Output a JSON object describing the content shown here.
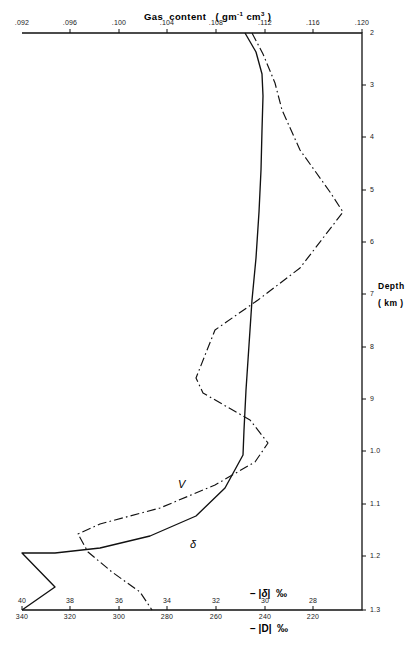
{
  "chart_data": {
    "type": "line",
    "orientation": "vertical-depth-profile",
    "grid": false,
    "legend": "inline-curve-labels",
    "axes": {
      "top": {
        "label": "Gas content  ( gm⁻¹ cm³ )",
        "ticks": [
          ".092",
          ".096",
          ".100",
          ".104",
          ".108",
          ".112",
          ".116",
          ".120"
        ],
        "range": [
          0.092,
          0.12
        ]
      },
      "right": {
        "label_line1": "Depth",
        "label_line2": "( km )",
        "ticks": [
          "2",
          "3",
          "4",
          "5",
          "6",
          "7",
          "8",
          "9",
          "1.0",
          "1.1",
          "1.2",
          "1.3"
        ],
        "range": [
          2,
          13
        ]
      },
      "bottom_primary": {
        "label": "- |δ|   ‰",
        "ticks": [
          "40",
          "38",
          "36",
          "34",
          "32",
          "30",
          "28"
        ],
        "range": [
          40,
          28
        ],
        "reversed": true
      },
      "bottom_secondary": {
        "label": "- |D|   ‰",
        "ticks": [
          "340",
          "320",
          "300",
          "280",
          "260",
          "240",
          "220"
        ],
        "range": [
          340,
          220
        ],
        "reversed": true
      }
    },
    "series": [
      {
        "name": "V",
        "style": "dash-dot",
        "label_text": "V",
        "points_px": [
          [
            252,
            33
          ],
          [
            263,
            54
          ],
          [
            275,
            83
          ],
          [
            282,
            110
          ],
          [
            300,
            150
          ],
          [
            330,
            192
          ],
          [
            343,
            212
          ],
          [
            300,
            268
          ],
          [
            258,
            300
          ],
          [
            215,
            330
          ],
          [
            196,
            378
          ],
          [
            203,
            393
          ],
          [
            250,
            420
          ],
          [
            268,
            443
          ],
          [
            255,
            462
          ],
          [
            215,
            485
          ],
          [
            160,
            508
          ],
          [
            100,
            524
          ],
          [
            78,
            534
          ],
          [
            88,
            552
          ],
          [
            112,
            572
          ],
          [
            140,
            592
          ],
          [
            152,
            610
          ]
        ]
      },
      {
        "name": "delta",
        "style": "solid",
        "label_text": "δ",
        "points_px": [
          [
            245,
            33
          ],
          [
            256,
            52
          ],
          [
            262,
            74
          ],
          [
            263,
            96
          ],
          [
            262,
            130
          ],
          [
            261,
            170
          ],
          [
            259,
            212
          ],
          [
            256,
            258
          ],
          [
            252,
            300
          ],
          [
            249,
            345
          ],
          [
            246,
            390
          ],
          [
            244,
            430
          ],
          [
            243,
            455
          ],
          [
            225,
            488
          ],
          [
            196,
            516
          ],
          [
            150,
            536
          ],
          [
            100,
            548
          ],
          [
            55,
            553
          ],
          [
            22,
            553
          ],
          [
            55,
            587
          ],
          [
            22,
            610
          ]
        ]
      }
    ]
  },
  "plot_frame": {
    "left_px": 22,
    "right_px": 362,
    "top_px": 33,
    "bottom_px": 610
  },
  "tick_positions": {
    "top_x": [
      22,
      70,
      119,
      167,
      216,
      265,
      313,
      362
    ],
    "right_y": [
      33,
      85,
      137,
      190,
      242,
      294,
      347,
      399,
      451,
      504,
      556,
      610
    ],
    "bottom_x": [
      22,
      70,
      119,
      167,
      216,
      265,
      313,
      362
    ]
  }
}
